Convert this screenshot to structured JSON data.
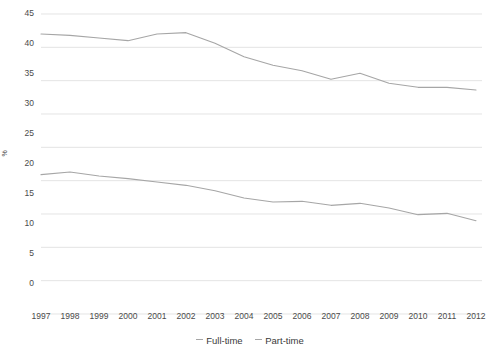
{
  "chart_data": {
    "type": "line",
    "title": "",
    "xlabel": "",
    "ylabel": "%",
    "categories": [
      "1997",
      "1998",
      "1999",
      "2000",
      "2001",
      "2002",
      "2003",
      "2004",
      "2005",
      "2006",
      "2007",
      "2008",
      "2009",
      "2010",
      "2011",
      "2012"
    ],
    "series": [
      {
        "name": "Full-time",
        "color": "#a6a6a6",
        "values": [
          42.0,
          41.8,
          41.4,
          41.0,
          42.0,
          42.2,
          40.6,
          38.6,
          37.3,
          36.5,
          35.2,
          36.1,
          34.6,
          34.0,
          34.0,
          33.6
        ]
      },
      {
        "name": "Part-time",
        "color": "#a6a6a6",
        "values": [
          20.9,
          21.3,
          20.7,
          20.3,
          19.8,
          19.3,
          18.5,
          17.4,
          16.8,
          16.9,
          16.3,
          16.6,
          15.9,
          14.9,
          15.1,
          14.0
        ]
      }
    ],
    "ylim": [
      0,
      45
    ],
    "yticks": [
      0,
      5,
      10,
      15,
      20,
      25,
      30,
      35,
      40,
      45
    ],
    "grid": true,
    "legend_position": "bottom",
    "axis_color": "#d9d9d9",
    "background": "#ffffff"
  },
  "yticks": {
    "t0": "0",
    "t1": "5",
    "t2": "10",
    "t3": "15",
    "t4": "20",
    "t5": "25",
    "t6": "30",
    "t7": "35",
    "t8": "40",
    "t9": "45"
  },
  "ylabel": {
    "text": "%"
  },
  "xticks": {
    "x0": "1997",
    "x1": "1998",
    "x2": "1999",
    "x3": "2000",
    "x4": "2001",
    "x5": "2002",
    "x6": "2003",
    "x7": "2004",
    "x8": "2005",
    "x9": "2006",
    "x10": "2007",
    "x11": "2008",
    "x12": "2009",
    "x13": "2010",
    "x14": "2011",
    "x15": "2012"
  },
  "legend": {
    "item0": "Full-time",
    "item1": "Part-time"
  }
}
